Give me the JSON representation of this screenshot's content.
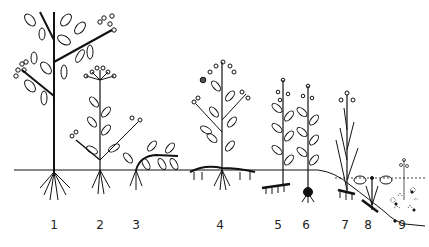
{
  "diagram": {
    "type": "plant life-form illustration",
    "ground_line": true,
    "water_line_dotted": true,
    "plants": [
      {
        "label": "1",
        "x": 54
      },
      {
        "label": "2",
        "x": 100
      },
      {
        "label": "3",
        "x": 136
      },
      {
        "label": "4",
        "x": 220
      },
      {
        "label": "5",
        "x": 278
      },
      {
        "label": "6",
        "x": 306
      },
      {
        "label": "7",
        "x": 345
      },
      {
        "label": "8",
        "x": 368
      },
      {
        "label": "9",
        "x": 402
      }
    ]
  }
}
